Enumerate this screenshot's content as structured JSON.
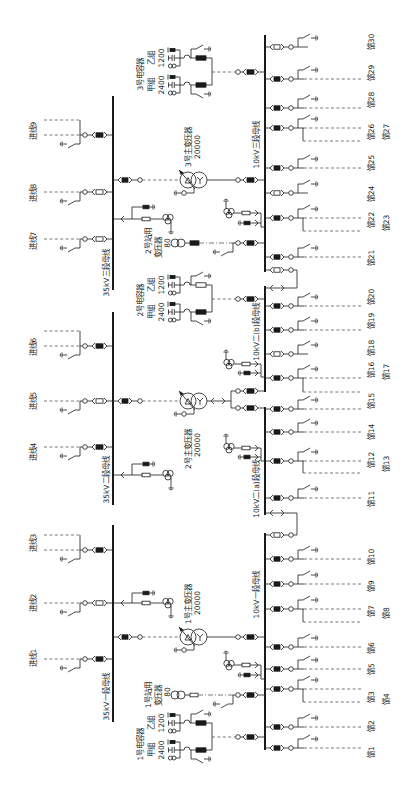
{
  "colors": {
    "background": "#ffffff",
    "line": "#1a1a1a",
    "dashed": "#555555",
    "text": "#1a1a1a",
    "breaker_closed": "#1a1a1a",
    "breaker_open": "#ffffff"
  },
  "buses_35kv": [
    {
      "label": "35kV三段母线",
      "y1": 96,
      "y2": 290,
      "label_y": 273
    },
    {
      "label": "35kV二段母线",
      "y1": 312,
      "y2": 505,
      "label_y": 480
    },
    {
      "label": "35kV一段母线",
      "y1": 525,
      "y2": 722,
      "label_y": 697
    }
  ],
  "buses_10kv": [
    {
      "label": "10kV三段母线",
      "y1": 35,
      "y2": 272,
      "label_y": 145
    },
    {
      "label": "10kV二(b)段母线",
      "y1": 286,
      "y2": 392,
      "label_y": 332
    },
    {
      "label": "10kV二(a)段母线",
      "y1": 407,
      "y2": 515,
      "label_y": 489
    },
    {
      "label": "10kV一段母线",
      "y1": 533,
      "y2": 750,
      "label_y": 595
    }
  ],
  "incoming_lines": [
    {
      "label": "进线9",
      "y": 135,
      "label_y": 131,
      "breaker": "closed",
      "double": true
    },
    {
      "label": "进线8",
      "y": 192,
      "label_y": 193,
      "breaker": "open",
      "double": false
    },
    {
      "label": "进线7",
      "y": 239,
      "label_y": 241,
      "breaker": "open",
      "double": false
    },
    {
      "label": "进线6",
      "y": 346,
      "label_y": 347,
      "breaker": "closed",
      "double": true
    },
    {
      "label": "进线5",
      "y": 401,
      "label_y": 401,
      "breaker": "open",
      "double": false
    },
    {
      "label": "进线4",
      "y": 447,
      "label_y": 452,
      "breaker": "closed",
      "double": false
    },
    {
      "label": "进线3",
      "y": 550,
      "label_y": 543,
      "breaker": "closed",
      "double": true
    },
    {
      "label": "进线2",
      "y": 603,
      "label_y": 603,
      "breaker": "open",
      "double": false
    },
    {
      "label": "进线1",
      "y": 659,
      "label_y": 658,
      "breaker": "closed",
      "double": false
    }
  ],
  "main_transformers": [
    {
      "name": "3号主变压器",
      "capacity": "20000",
      "y": 180,
      "lv_y": [
        180
      ],
      "name_y": 147,
      "capacity_y": 147
    },
    {
      "name": "2号主变压器",
      "capacity": "20000",
      "y": 401,
      "lv_y": [
        391,
        408
      ],
      "name_y": 449,
      "capacity_y": 445
    },
    {
      "name": "1号主变压器",
      "capacity": "20000",
      "y": 637,
      "lv_y": [
        637
      ],
      "name_y": 604,
      "capacity_y": 603
    }
  ],
  "capacitor_banks": [
    {
      "name": "3号电容器",
      "y": 72,
      "label_y": 74,
      "groups": [
        {
          "name": "乙组",
          "kvar": "1200",
          "y": 58,
          "breaker": "closed"
        },
        {
          "name": "甲组",
          "kvar": "2400",
          "y": 85,
          "breaker": "closed"
        }
      ]
    },
    {
      "name": "2号电容器",
      "y": 299,
      "label_y": 300,
      "groups": [
        {
          "name": "乙组",
          "kvar": "1200",
          "y": 285,
          "breaker": "open"
        },
        {
          "name": "甲组",
          "kvar": "2400",
          "y": 312,
          "breaker": "closed"
        }
      ]
    },
    {
      "name": "1号电容器",
      "y": 737,
      "label_y": 744,
      "groups": [
        {
          "name": "乙组",
          "kvar": "1200",
          "y": 723,
          "breaker": "closed"
        },
        {
          "name": "甲组",
          "kvar": "2400",
          "y": 750,
          "breaker": "closed"
        }
      ]
    }
  ],
  "station_transformers": [
    {
      "name_line1": "2号站用",
      "name_line2": "变压器",
      "capacity": "80",
      "y": 243,
      "name1_y": 241,
      "name2_y": 247,
      "capacity_y": 243,
      "protection": "breaker"
    },
    {
      "name_line1": "1号站用",
      "name_line2": "变压器",
      "capacity": "80",
      "y": 695,
      "name1_y": 695,
      "name2_y": 695,
      "capacity_y": 692,
      "protection": "fuse"
    }
  ],
  "pt_35kv": [
    {
      "y": 219,
      "arrester_y": 207
    },
    {
      "y": 475,
      "arrester_y": 464
    },
    {
      "y": 603,
      "arrester_y": 593
    }
  ],
  "pt_10kv": [
    {
      "y": 213,
      "arrester_y": 223
    },
    {
      "y": 364,
      "arrester_y": 373
    },
    {
      "y": 448,
      "arrester_y": 457
    },
    {
      "y": 665,
      "arrester_y": 675
    }
  ],
  "bus_ties_10kv": [
    {
      "breaker_y": 270,
      "disconnector_y": 288,
      "breaker": "open"
    },
    {
      "breaker_y": 535,
      "disconnector_y": 513,
      "breaker": "open"
    }
  ],
  "feeders": [
    {
      "label": "馈30",
      "y": 47,
      "label_y": 42,
      "breaker": "open"
    },
    {
      "label": "馈29",
      "y": 79,
      "label_y": 73,
      "breaker": "closed"
    },
    {
      "label": "馈28",
      "y": 108,
      "label_y": 100,
      "breaker": "closed"
    },
    {
      "label": "馈26",
      "y": 128,
      "label_y": 132,
      "breaker": "closed",
      "branch": {
        "label": "馈27",
        "y": 141,
        "label_y": 132
      }
    },
    {
      "label": "馈25",
      "y": 168,
      "label_y": 163,
      "breaker": "closed"
    },
    {
      "label": "馈24",
      "y": 193,
      "label_y": 194,
      "breaker": "open"
    },
    {
      "label": "馈22",
      "y": 218,
      "label_y": 220,
      "breaker": "closed",
      "branch": {
        "label": "馈23",
        "y": 231,
        "label_y": 223
      }
    },
    {
      "label": "馈21",
      "y": 257,
      "label_y": 258,
      "breaker": "closed"
    },
    {
      "label": "馈20",
      "y": 306,
      "label_y": 297,
      "breaker": "closed"
    },
    {
      "label": "馈19",
      "y": 330,
      "label_y": 321,
      "breaker": "closed"
    },
    {
      "label": "馈18",
      "y": 354,
      "label_y": 348,
      "breaker": "open"
    },
    {
      "label": "馈16",
      "y": 378,
      "label_y": 370,
      "breaker": "closed",
      "branch": {
        "label": "馈17",
        "y": 392,
        "label_y": 372
      }
    },
    {
      "label": "馈15",
      "y": 409,
      "label_y": 401,
      "breaker": "closed"
    },
    {
      "label": "馈14",
      "y": 432,
      "label_y": 432,
      "breaker": "closed"
    },
    {
      "label": "馈12",
      "y": 461,
      "label_y": 460,
      "breaker": "closed",
      "branch": {
        "label": "馈13",
        "y": 473,
        "label_y": 464
      }
    },
    {
      "label": "馈11",
      "y": 498,
      "label_y": 499,
      "breaker": "closed"
    },
    {
      "label": "馈10",
      "y": 559,
      "label_y": 557,
      "breaker": "closed"
    },
    {
      "label": "馈9",
      "y": 584,
      "label_y": 586,
      "breaker": "closed"
    },
    {
      "label": "馈7",
      "y": 609,
      "label_y": 611,
      "breaker": "closed",
      "branch": {
        "label": "馈8",
        "y": 622,
        "label_y": 613
      }
    },
    {
      "label": "馈6",
      "y": 647,
      "label_y": 648,
      "breaker": "closed"
    },
    {
      "label": "馈5",
      "y": 669,
      "label_y": 669,
      "breaker": "closed"
    },
    {
      "label": "馈3",
      "y": 689,
      "label_y": 697,
      "breaker": "closed",
      "branch": {
        "label": "馈4",
        "y": 702,
        "label_y": 699
      }
    },
    {
      "label": "馈2",
      "y": 727,
      "label_y": 726,
      "breaker": "closed"
    },
    {
      "label": "馈1",
      "y": 748,
      "label_y": 752,
      "breaker": "closed"
    }
  ]
}
